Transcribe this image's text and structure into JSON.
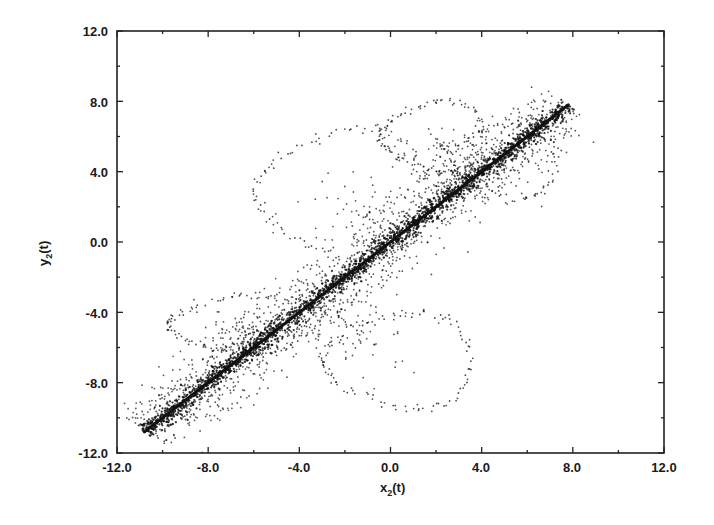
{
  "chart_data": {
    "type": "scatter",
    "title": "",
    "xlabel": "x2(t)",
    "ylabel": "y2(t)",
    "xlabel_main": "x",
    "xlabel_sub": "2",
    "xlabel_tail": "(t)",
    "ylabel_main": "y",
    "ylabel_sub": "2",
    "ylabel_tail": "(t)",
    "xlim": [
      -12.0,
      12.0
    ],
    "ylim": [
      -12.0,
      12.0
    ],
    "grid": false,
    "legend": null,
    "x_ticks": [
      "-12.0",
      "-8.0",
      "-4.0",
      "0.0",
      "4.0",
      "8.0",
      "12.0"
    ],
    "y_ticks": [
      "-12.0",
      "-8.0",
      "-4.0",
      "0.0",
      "4.0",
      "8.0",
      "12.0"
    ],
    "minor_tick_step": 2.0,
    "major_tick_step": 4.0,
    "series": [
      {
        "name": "synchronized band",
        "description": "dense cloud of points concentrated along the diagonal y = x",
        "line_start": [
          -10.8,
          -10.8
        ],
        "line_end": [
          7.8,
          7.8
        ],
        "spread": 0.9,
        "point_count": 3500
      },
      {
        "name": "dotted excursion loops",
        "description": "sparse dotted trajectory loops departing from the diagonal",
        "loops": [
          {
            "center": [
              -2.0,
              3.0
            ],
            "approx_extent_x": [
              -6.0,
              1.5
            ],
            "approx_extent_y": [
              -1.0,
              6.5
            ]
          },
          {
            "center": [
              -7.0,
              -5.0
            ],
            "approx_extent_x": [
              -9.8,
              -4.0
            ],
            "approx_extent_y": [
              -6.4,
              -3.0
            ]
          },
          {
            "center": [
              0.5,
              -6.0
            ],
            "approx_extent_x": [
              -3.0,
              3.5
            ],
            "approx_extent_y": [
              -9.5,
              -4.0
            ]
          },
          {
            "center": [
              4.5,
              3.5
            ],
            "approx_extent_x": [
              2.5,
              7.2
            ],
            "approx_extent_y": [
              2.5,
              6.8
            ]
          },
          {
            "center": [
              2.0,
              6.5
            ],
            "approx_extent_x": [
              -0.5,
              4.0
            ],
            "approx_extent_y": [
              4.0,
              8.0
            ]
          }
        ]
      }
    ]
  }
}
